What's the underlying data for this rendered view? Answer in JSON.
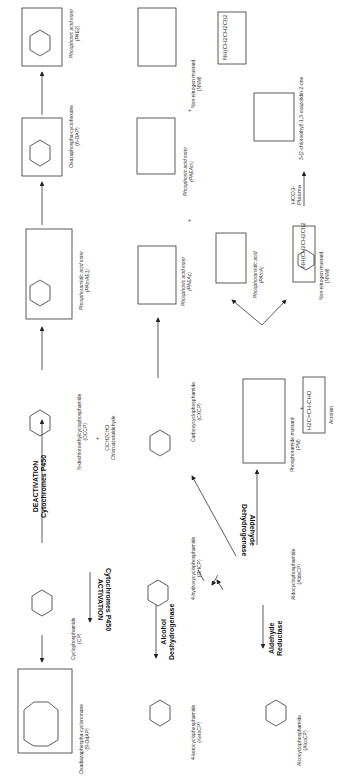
{
  "figure": {
    "orientation": "rotated-90-ccw"
  },
  "compounds": {
    "cp": {
      "name": "Cyclophosphamide",
      "abbr": "(CP)",
      "group": "N(CH2CH2Cl)2"
    },
    "ohcp": {
      "name": "4-hydroxycyclophosphamide",
      "abbr": "(OHCP)"
    },
    "ketocp": {
      "name": "4-ketocyclophosphamide",
      "abbr": "(KetoCP)"
    },
    "aldocp": {
      "name": "Aldocyclophosphamide",
      "abbr": "(AldoCP)"
    },
    "alcocp": {
      "name": "Alcocyclophosphamide",
      "abbr": "(AlcoCP)"
    },
    "cxcp": {
      "name": "Carboxycyclophosphamide",
      "abbr": "(CXCP)"
    },
    "dccp": {
      "name": "N-dechloroethylcyclophosphamide",
      "abbr": "(DCCP)"
    },
    "chloroacetaldehyde": {
      "formula": "ClCH2CHO",
      "name": "Chloroacetaldehyde"
    },
    "pm": {
      "name": "Phosphoramide mustard",
      "abbr": "(PM)"
    },
    "acrolein": {
      "formula": "H2C=CH-CHO",
      "name": "Acrolein"
    },
    "pama": {
      "name": "Phosphoramidic acid",
      "abbr": "(PAmA)"
    },
    "nnm_lower": {
      "formula": "NH(CH2CH2Cl)2",
      "name": "Non-nitrogen mustard",
      "abbr": "(NNM)"
    },
    "nnm_upper": {
      "formula": "NH(CH2CH2Cl)2",
      "name": "Non-nitrogen mustard",
      "abbr": "(NNM)"
    },
    "paeac": {
      "name": "Phosphonic acid ester",
      "abbr": "(PAEAc)"
    },
    "paeam": {
      "name": "Phosphonic acid ester",
      "abbr": "(PAEAm)"
    },
    "oxazolidinone": {
      "formula": "NCH2CH2Cl",
      "name": "3-(2-chloroethyl)-1,3-oxazolidin-2-one"
    },
    "pamae1": {
      "name": "Phosphoramidic acid ester",
      "abbr": "(PAmAE1)"
    },
    "ocap": {
      "name": "Oxazaphospha-cyclohexane",
      "abbr": "(6-OAP)"
    },
    "pae2": {
      "name": "Phosphonic acid ester",
      "abbr": "(PAE2)"
    },
    "odcap": {
      "name": "Oxadiazaphospha-cyclononane",
      "abbr": "(9-OdAP)"
    }
  },
  "arrows": {
    "activation": {
      "top": "Cytochromes P450",
      "bottom": "ACTIVATION"
    },
    "deactivation": {
      "top": "DEACTIVATION",
      "bottom": "Cytochromes P450"
    },
    "alcohol_dh": {
      "top": "Alcohol",
      "bottom": "Deshydrogenase"
    },
    "aldehyde_red": {
      "top": "Aldehyde",
      "bottom": "Reductase"
    },
    "aldehyde_dh": {
      "top": "Aldehyde",
      "bottom": "Dehydrogenase"
    },
    "plasma": {
      "top": "HCO3-",
      "bottom": "Plasma"
    }
  },
  "misc": {
    "plus": "+",
    "ring_numbers": [
      "1",
      "2",
      "3",
      "4",
      "5",
      "6"
    ]
  }
}
